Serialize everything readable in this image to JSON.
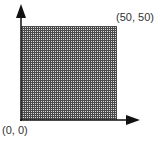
{
  "diagram": {
    "corner_top_right_label": "(50, 50)",
    "origin_label": "(0, 0)",
    "region": {
      "x_min": 0,
      "y_min": 0,
      "x_max": 50,
      "y_max": 50,
      "fill": "grid-hatched",
      "fill_color": "#555555"
    },
    "axis_color": "#111111"
  }
}
